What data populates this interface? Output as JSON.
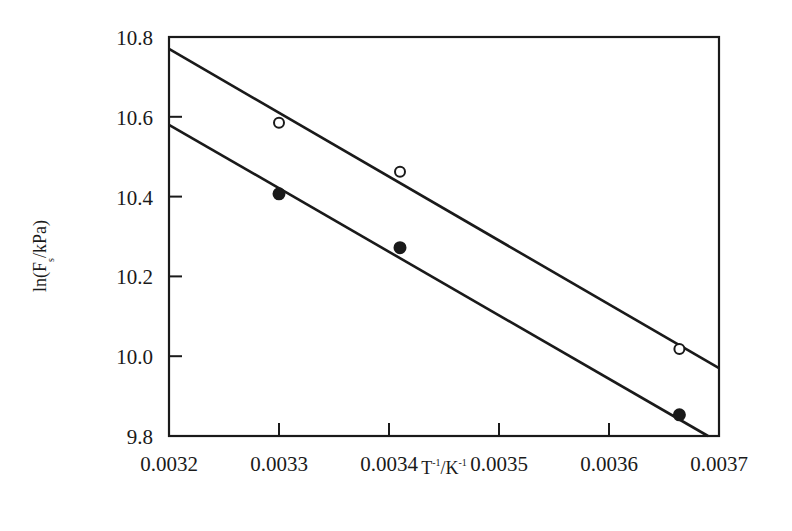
{
  "chart_data": {
    "type": "scatter",
    "title": "",
    "xlabel": "T^-1/K^-1",
    "xlabel_parts": {
      "base1": "T",
      "sup1": "-1",
      "sep": "/K",
      "sup2": "-1"
    },
    "ylabel": "ln(F_s/kPa)",
    "ylabel_parts": {
      "pre": "ln(F",
      "sub": "s",
      "post": "/kPa)"
    },
    "xlim": [
      0.0032,
      0.0037
    ],
    "ylim": [
      9.8,
      10.8
    ],
    "x_ticks": [
      "0.0032",
      "0.0033",
      "0.0034",
      "0.0035",
      "0.0036",
      "0.0037"
    ],
    "y_ticks": [
      "9.8",
      "10.0",
      "10.2",
      "10.4",
      "10.6",
      "10.8"
    ],
    "grid": false,
    "legend": null,
    "series": [
      {
        "name": "open circles",
        "marker": "open-circle",
        "x": [
          0.0033,
          0.00341,
          0.003664
        ],
        "y": [
          10.585,
          10.462,
          10.018
        ],
        "fit_line": {
          "x": [
            0.0032,
            0.0037
          ],
          "y": [
            10.77,
            9.97
          ]
        }
      },
      {
        "name": "filled circles",
        "marker": "filled-circle",
        "x": [
          0.0033,
          0.00341,
          0.003664
        ],
        "y": [
          10.407,
          10.272,
          9.853
        ],
        "fit_line": {
          "x": [
            0.0032,
            0.00369
          ],
          "y": [
            10.58,
            9.8
          ]
        }
      }
    ]
  },
  "colors": {
    "ink": "#1a1a1a",
    "background": "#ffffff"
  }
}
